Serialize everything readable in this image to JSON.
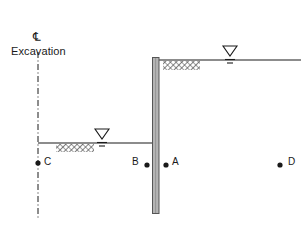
{
  "diagram": {
    "type": "geotechnical-excavation-cross-section",
    "labels": {
      "centerline_symbol": "℄",
      "excavation": "Excavation"
    },
    "points": [
      {
        "id": "A",
        "label": "A",
        "dot_x": 166,
        "dot_y": 165,
        "label_x": 172,
        "label_y": 157
      },
      {
        "id": "B",
        "label": "B",
        "dot_x": 147,
        "dot_y": 165,
        "label_x": 132,
        "label_y": 157
      },
      {
        "id": "C",
        "label": "C",
        "dot_x": 38,
        "dot_y": 163,
        "label_x": 44,
        "label_y": 157
      },
      {
        "id": "D",
        "label": "D",
        "dot_x": 280,
        "dot_y": 165,
        "label_x": 288,
        "label_y": 157
      }
    ],
    "geometry": {
      "centerline": {
        "x": 38,
        "y_top": 52,
        "y_bottom": 219
      },
      "wall": {
        "x": 152,
        "y_top": 57,
        "width": 7,
        "height": 157
      },
      "ground_line_right": {
        "x1": 159,
        "x2": 300,
        "y": 60
      },
      "ground_line_left": {
        "x1": 38,
        "x2": 152,
        "y": 143
      },
      "hatch_right": {
        "x": 163,
        "y": 61,
        "width": 37,
        "height": 9
      },
      "hatch_left": {
        "x": 56,
        "y": 144,
        "width": 38,
        "height": 8
      },
      "water_table_right": {
        "x": 230,
        "y": 50
      },
      "water_table_left": {
        "x": 102,
        "y": 133
      }
    },
    "colors": {
      "line": "#1a1a1a",
      "wall_fill": "#b4b4b4",
      "wall_stroke": "#555555",
      "hatch": "#4d4d4d",
      "background": "#ffffff"
    }
  }
}
